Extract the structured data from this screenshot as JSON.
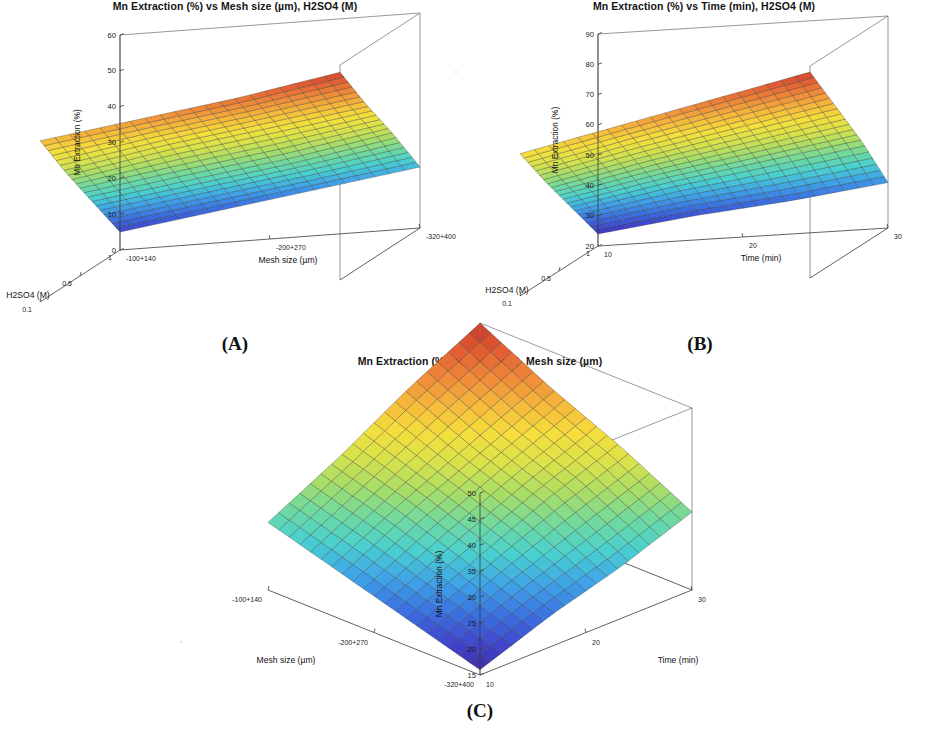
{
  "figure": {
    "background": "#ffffff",
    "colormap": "jet",
    "colormap_stops": [
      "#3a2a8f",
      "#4040c8",
      "#3b6fe0",
      "#3fa3e8",
      "#49d0d0",
      "#6fd9a0",
      "#a8dd68",
      "#d9e24a",
      "#f4df3c",
      "#f6b93b",
      "#ef8a3a",
      "#e05c33",
      "#c33a2c"
    ]
  },
  "panels": [
    {
      "id": "A",
      "caption": "(A)",
      "title": "Mn Extraction (%) vs Mesh size (µm), H2SO4 (M)",
      "zlabel": "Mn Extraction (%)",
      "xlabel": "H2SO4 (M)",
      "ylabel": "Mesh size (µm)",
      "zticks": [
        "0",
        "10",
        "20",
        "30",
        "40",
        "50",
        "60"
      ],
      "xticks": [
        "1",
        "0.5",
        "0.1"
      ],
      "yticks": [
        "-100+140",
        "-200+270",
        "-320+400"
      ]
    },
    {
      "id": "B",
      "caption": "(B)",
      "title": "Mn Extraction (%) vs Time (min), H2SO4 (M)",
      "zlabel": "Mn Extraction (%)",
      "xlabel": "H2SO4 (M)",
      "ylabel": "Time (min)",
      "zticks": [
        "20",
        "30",
        "40",
        "50",
        "60",
        "70",
        "80",
        "90"
      ],
      "xticks": [
        "1",
        "0.5",
        "0.1"
      ],
      "yticks": [
        "10",
        "20",
        "30"
      ]
    },
    {
      "id": "C",
      "caption": "(C)",
      "title": "Mn Extraction (%) vs Time (min), Mesh size (µm)",
      "zlabel": "Mn Extraction (%)",
      "xlabel": "Mesh size (µm)",
      "ylabel": "Time (min)",
      "zticks": [
        "15",
        "20",
        "25",
        "30",
        "35",
        "40",
        "45",
        "50"
      ],
      "xticks": [
        "-320+400",
        "-200+270",
        "-100+140"
      ],
      "yticks": [
        "10",
        "20",
        "30"
      ]
    }
  ],
  "chart_data": [
    {
      "type": "surface",
      "panel": "A",
      "title": "Mn Extraction (%) vs Mesh size (µm), H2SO4 (M)",
      "xlabel": "H2SO4 (M)",
      "ylabel": "Mesh size (µm)",
      "zlabel": "Mn Extraction (%)",
      "x": [
        1,
        0.5,
        0.1
      ],
      "y": [
        "-100+140",
        "-200+270",
        "-320+400"
      ],
      "zlim": [
        0,
        60
      ],
      "zticks": [
        0,
        10,
        20,
        30,
        40,
        50,
        60
      ],
      "grid": true,
      "legend": "none",
      "corner_values": {
        "x_low_y_low": 5,
        "x_low_y_high": 17,
        "x_high_y_low": 45,
        "x_high_y_high": 58
      },
      "z_matrix": [
        [
          5,
          9,
          13,
          17
        ],
        [
          18,
          22,
          26,
          31
        ],
        [
          31,
          36,
          40,
          44
        ],
        [
          45,
          49,
          53,
          58
        ]
      ]
    },
    {
      "type": "surface",
      "panel": "B",
      "title": "Mn Extraction (%) vs Time (min), H2SO4 (M)",
      "xlabel": "H2SO4 (M)",
      "ylabel": "Time (min)",
      "zlabel": "Mn Extraction (%)",
      "x": [
        1,
        0.5,
        0.1
      ],
      "y": [
        10,
        20,
        30
      ],
      "zlim": [
        20,
        90
      ],
      "zticks": [
        20,
        30,
        40,
        50,
        60,
        70,
        80,
        90
      ],
      "grid": true,
      "legend": "none",
      "corner_values": {
        "x_low_y_low": 24,
        "x_low_y_high": 35,
        "x_high_y_low": 67,
        "x_high_y_high": 88
      },
      "z_matrix": [
        [
          24,
          28,
          31,
          35
        ],
        [
          38,
          44,
          49,
          54
        ],
        [
          52,
          59,
          65,
          71
        ],
        [
          67,
          74,
          81,
          88
        ]
      ]
    },
    {
      "type": "surface",
      "panel": "C",
      "title": "Mn Extraction (%) vs Time (min), Mesh size (µm)",
      "xlabel": "Mesh size (µm)",
      "ylabel": "Time (min)",
      "zlabel": "Mn Extraction (%)",
      "x": [
        "-320+400",
        "-200+270",
        "-100+140"
      ],
      "y": [
        10,
        20,
        30
      ],
      "zlim": [
        15,
        50
      ],
      "zticks": [
        15,
        20,
        25,
        30,
        35,
        40,
        45,
        50
      ],
      "grid": true,
      "legend": "none",
      "corner_values": {
        "x_low_y_low": 16,
        "x_low_y_high": 30,
        "x_high_y_low": 28,
        "x_high_y_high": 50
      },
      "z_matrix": [
        [
          16,
          21,
          25,
          30
        ],
        [
          20,
          26,
          32,
          37
        ],
        [
          24,
          31,
          37,
          43
        ],
        [
          28,
          35,
          43,
          50
        ]
      ]
    }
  ]
}
